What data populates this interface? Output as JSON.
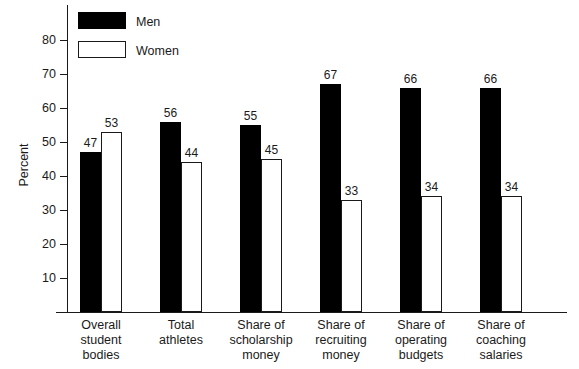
{
  "chart_data": {
    "type": "bar",
    "title": "",
    "xlabel": "",
    "ylabel": "Percent",
    "ylim": [
      0,
      85
    ],
    "yticks": [
      10,
      20,
      30,
      40,
      50,
      60,
      70,
      80
    ],
    "grid": false,
    "legend_position": "top-left",
    "categories": [
      "Overall\nstudent\nbodies",
      "Total\nathletes",
      "Share of\nscholarship\nmoney",
      "Share of\nrecruiting\nmoney",
      "Share of\noperating\nbudgets",
      "Share of\ncoaching\nsalaries"
    ],
    "series": [
      {
        "name": "Men",
        "color": "#000000",
        "values": [
          47,
          56,
          55,
          67,
          66,
          66
        ]
      },
      {
        "name": "Women",
        "color": "#ffffff",
        "values": [
          53,
          44,
          45,
          33,
          34,
          34
        ]
      }
    ]
  },
  "legend": {
    "items": [
      {
        "label": "Men",
        "style": "filled-black"
      },
      {
        "label": "Women",
        "style": "outlined-white"
      }
    ]
  },
  "axis": {
    "y_title": "Percent",
    "tick_labels": [
      "80",
      "70",
      "60",
      "50",
      "40",
      "30",
      "20",
      "10"
    ]
  },
  "colors": {
    "men_fill": "#000000",
    "women_fill": "#ffffff",
    "outline": "#1a1a1a",
    "background": "#ffffff"
  }
}
